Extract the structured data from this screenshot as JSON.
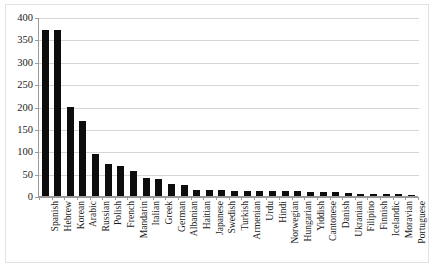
{
  "chart_data": {
    "type": "bar",
    "title": "",
    "subtitle": "",
    "xlabel": "",
    "ylabel": "",
    "ylim": [
      0,
      400
    ],
    "ytick_step": 50,
    "yticks": [
      "0",
      "50",
      "100",
      "150",
      "200",
      "250",
      "300",
      "350",
      "400"
    ],
    "grid": true,
    "legend": false,
    "bar_color": "#0d0d0d",
    "gridline_color": "#d6d6d6",
    "axis_color": "#9a9a9a",
    "categories": [
      "Spanish",
      "Hebrew",
      "Korean",
      "Arabic",
      "Russian",
      "Polish",
      "French",
      "Mandarin",
      "Italian",
      "Greek",
      "German",
      "Albanian",
      "Haitian",
      "Japanese",
      "Swedish",
      "Turkish",
      "Armenian",
      "Urdu",
      "Hindi",
      "Norwegian",
      "Hungarian",
      "Yiddish",
      "Cantonese",
      "Danish",
      "Ukranian",
      "Filipino",
      "Finnish",
      "Icelandic",
      "Moravian",
      "Portuguese"
    ],
    "values": [
      370,
      370,
      199,
      167,
      94,
      72,
      68,
      57,
      40,
      38,
      27,
      25,
      14,
      13,
      13,
      12,
      12,
      12,
      11,
      11,
      11,
      10,
      10,
      9,
      7,
      5,
      5,
      5,
      4,
      3
    ]
  }
}
